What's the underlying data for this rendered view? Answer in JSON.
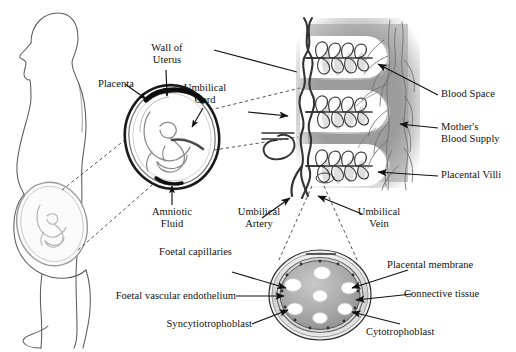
{
  "diagram": {
    "background_color": "#ffffff",
    "ink_color": "#111111",
    "panel_gray": "#9c9c9c",
    "blood_space_white": "#ffffff"
  },
  "labels": {
    "placenta": "Placenta",
    "wall_of_uterus_line1": "Wall of",
    "wall_of_uterus_line2": "Uterus",
    "umbilical_cord_line1": "Umbilical",
    "umbilical_cord_line2": "Cord",
    "amniotic_fluid_line1": "Amniotic",
    "amniotic_fluid_line2": "Fluid",
    "blood_space": "Blood Space",
    "mothers_blood_supply_line1": "Mother's",
    "mothers_blood_supply_line2": "Blood Supply",
    "placental_villi": "Placental Villi",
    "umbilical_artery_line1": "Umbilical",
    "umbilical_artery_line2": "Artery",
    "umbilical_vein_line1": "Umbilical",
    "umbilical_vein_line2": "Vein",
    "foetal_capillaries": "Foetal capillaries",
    "foetal_vascular_endothelium": "Foetal vascular endothelium",
    "syncytiotrophoblast": "Syncytiotrophoblast",
    "placental_membrane": "Placental membrane",
    "connective_tissue": "Connective tissue",
    "cytotrophoblast": "Cytotrophoblast"
  },
  "panels": {
    "woman_silhouette": "pregnant-woman-profile",
    "uterus_detail": "uterus-with-foetus-oval",
    "villi_panel": "placental-villi-cross-section-panel",
    "villus_section": "villus-transverse-section-circle"
  },
  "villi_panel": {
    "blood_space_count": 3,
    "villus_branch_count": 3
  },
  "villus_section": {
    "capillary_count": 7,
    "ring_layers": [
      "syncytiotrophoblast",
      "cytotrophoblast",
      "connective tissue",
      "placental membrane"
    ]
  }
}
